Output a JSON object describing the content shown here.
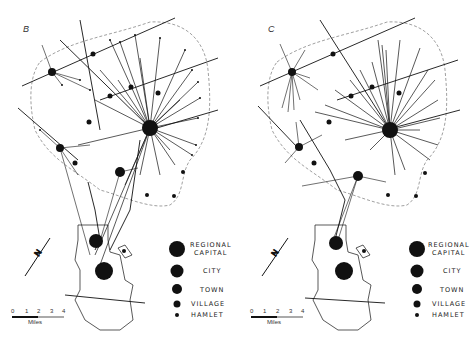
{
  "panels": [
    {
      "id": "B",
      "label": "B",
      "offset_x": 0
    },
    {
      "id": "C",
      "label": "C",
      "offset_x": 237
    }
  ],
  "legend": {
    "items": [
      {
        "label": "REGIONAL",
        "label2": "CAPITAL",
        "size": "regional-capital"
      },
      {
        "label": "CITY",
        "size": "city"
      },
      {
        "label": "TOWN",
        "size": "town"
      },
      {
        "label": "VILLAGE",
        "size": "village"
      },
      {
        "label": "HAMLET",
        "size": "hamlet"
      }
    ]
  },
  "scale_bar": {
    "ticks": [
      "0",
      "1",
      "2",
      "3",
      "4"
    ],
    "unit": "Miles"
  },
  "north_arrow": {
    "label": "N"
  },
  "colors": {
    "ink": "#111111",
    "dashed_boundary": "#888888",
    "background": "#ffffff"
  }
}
